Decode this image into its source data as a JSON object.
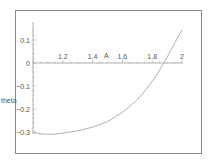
{
  "chart_data": {
    "type": "line",
    "title": "",
    "xlabel": "A",
    "ylabel": "theta",
    "xlim": [
      1.0,
      2.0
    ],
    "ylim": [
      -0.32,
      0.17
    ],
    "grid": false,
    "legend": null,
    "x_ticks": [
      "1.2",
      "1.4",
      "1.6",
      "1.8",
      "2"
    ],
    "y_ticks": [
      "0.1",
      "0",
      "-0.1",
      "-0.2",
      "-0.3"
    ],
    "series": [
      {
        "name": "theta(A)",
        "x": [
          1.0,
          1.05,
          1.1,
          1.15,
          1.2,
          1.3,
          1.4,
          1.5,
          1.6,
          1.7,
          1.75,
          1.8,
          1.85,
          1.9,
          1.95,
          2.0
        ],
        "values": [
          -0.302,
          -0.308,
          -0.31,
          -0.309,
          -0.305,
          -0.295,
          -0.279,
          -0.255,
          -0.215,
          -0.16,
          -0.122,
          -0.08,
          -0.03,
          0.025,
          0.085,
          0.145
        ]
      }
    ]
  },
  "plot": {
    "frame": {
      "x": 15,
      "y": 10,
      "w": 186,
      "h": 143
    },
    "origin_px": {
      "x": 33,
      "y": 63
    },
    "x_scale_px_per_unit": 149,
    "y_scale_px_per_unit": 230,
    "x_min": 1.0,
    "y_axis_top_px": 22,
    "y_axis_bottom_px": 134,
    "x_axis_end_px": 183,
    "frame_color": "#8a8a8a",
    "curve_color": "#a8a8a8",
    "text_color": "#555555"
  }
}
